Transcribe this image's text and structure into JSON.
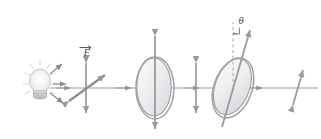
{
  "figure": {
    "background_color": "#ffffff",
    "stroke_color": "#8c8c8c",
    "dark_stroke_color": "#6e6e6e",
    "ellipse_fill_light": "#f2f2f2",
    "ellipse_fill_mid": "#d8dadd",
    "bulb_glow_color": "#efefef"
  },
  "labels": {
    "e_field": "E",
    "e_field_name": "electric-field-vector",
    "theta": "θ",
    "theta_name": "polarizer-rotation-angle"
  },
  "elements": {
    "light_source": {
      "name": "incandescent-light-bulb",
      "emits": "unpolarized-light",
      "ray_count": 3
    },
    "unpolarized_beam": {
      "name": "unpolarized-e-field-cross",
      "arrows": [
        "vertical",
        "diagonal"
      ]
    },
    "polarizer_one": {
      "name": "first-polarizing-filter",
      "transmission_axis": "vertical",
      "tilt_degrees": 0
    },
    "polarized_beam_one": {
      "name": "vertically-polarized-beam",
      "orientation": "vertical"
    },
    "polarizer_two": {
      "name": "second-polarizing-filter",
      "transmission_axis": "tilted",
      "tilt_degrees": 20
    },
    "polarized_beam_two": {
      "name": "tilted-polarized-beam",
      "orientation": "tilted"
    },
    "optical_axis": {
      "name": "optical-beam-axis",
      "direction": "left-to-right"
    }
  }
}
